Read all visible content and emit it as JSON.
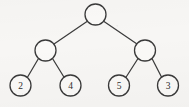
{
  "diagram": {
    "kind": "binary-tree",
    "background_color": "#f7f6f4",
    "stroke_color": "#3a3a3a",
    "node_fill_color": "#faf9f7",
    "label_color": "#2e2e2e",
    "node_radius": 10.5,
    "nodes": [
      {
        "id": "root",
        "label": "",
        "cx": 95.5,
        "cy": 14.5,
        "level": 0,
        "role": "root"
      },
      {
        "id": "internal-l",
        "label": "",
        "cx": 45.5,
        "cy": 50.5,
        "level": 1,
        "role": "internal"
      },
      {
        "id": "internal-r",
        "label": "",
        "cx": 145.0,
        "cy": 50.5,
        "level": 1,
        "role": "internal"
      },
      {
        "id": "leaf-2",
        "label": "2",
        "cx": 20.5,
        "cy": 85.5,
        "level": 2,
        "role": "leaf"
      },
      {
        "id": "leaf-4",
        "label": "4",
        "cx": 70.5,
        "cy": 85.5,
        "level": 2,
        "role": "leaf"
      },
      {
        "id": "leaf-5",
        "label": "5",
        "cx": 119.0,
        "cy": 85.5,
        "level": 2,
        "role": "leaf"
      },
      {
        "id": "leaf-3",
        "label": "3",
        "cx": 168.0,
        "cy": 85.5,
        "level": 2,
        "role": "leaf"
      }
    ],
    "edges": [
      {
        "id": "edge-root-left",
        "from": "root",
        "to": "internal-l",
        "x1": 87.0,
        "y1": 21.5,
        "x2": 54.0,
        "y2": 44.0
      },
      {
        "id": "edge-root-right",
        "from": "root",
        "to": "internal-r",
        "x1": 104.0,
        "y1": 21.5,
        "x2": 137.0,
        "y2": 44.0
      },
      {
        "id": "edge-internal-l-leaf2",
        "from": "internal-l",
        "to": "leaf-2",
        "x1": 38.5,
        "y1": 58.5,
        "x2": 27.0,
        "y2": 78.0
      },
      {
        "id": "edge-internal-l-leaf4",
        "from": "internal-l",
        "to": "leaf-4",
        "x1": 52.5,
        "y1": 58.5,
        "x2": 64.5,
        "y2": 78.0
      },
      {
        "id": "edge-internal-r-leaf5",
        "from": "internal-r",
        "to": "leaf-5",
        "x1": 138.0,
        "y1": 58.5,
        "x2": 125.5,
        "y2": 78.0
      },
      {
        "id": "edge-internal-r-leaf3",
        "from": "internal-r",
        "to": "leaf-3",
        "x1": 152.0,
        "y1": 58.5,
        "x2": 162.0,
        "y2": 78.0
      }
    ],
    "leaf_values": [
      "2",
      "4",
      "5",
      "3"
    ]
  }
}
